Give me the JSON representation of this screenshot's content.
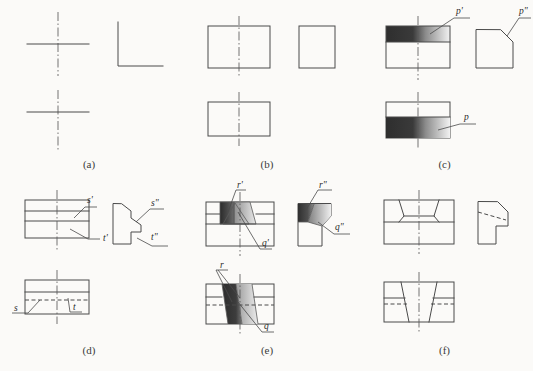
{
  "figure": {
    "background_color": "#fbfaf8",
    "line_color": "#4a4a4a",
    "panel_columns": 3,
    "panel_rows": 2
  },
  "panels": [
    {
      "id": "a",
      "caption": "(a)",
      "description": "Point projections: crossed centre lines in front and top views, corner lines in side view",
      "labels": [],
      "views": [
        "front",
        "side",
        "top"
      ]
    },
    {
      "id": "b",
      "caption": "(b)",
      "description": "Rectangular plate: rectangle front view, square side view, rectangle top view",
      "labels": [],
      "views": [
        "front",
        "side",
        "top"
      ]
    },
    {
      "id": "c",
      "caption": "(c)",
      "description": "Inclined plane p: shaded band in front and top views, chamfered corner in side view",
      "labels": [
        "p'",
        "p\"",
        "p"
      ],
      "views": [
        "front",
        "side",
        "top"
      ]
    },
    {
      "id": "d",
      "caption": "(d)",
      "description": "Planes s and t on a stepped block with notch",
      "labels": [
        "s'",
        "t'",
        "s\"",
        "t\"",
        "s",
        "t"
      ],
      "views": [
        "front",
        "side",
        "top"
      ]
    },
    {
      "id": "e",
      "caption": "(e)",
      "description": "Planes r and q on a block with a tapered slot, shaded faces",
      "labels": [
        "r'",
        "q'",
        "r\"",
        "q\"",
        "r",
        "q"
      ],
      "views": [
        "front",
        "side",
        "top"
      ]
    },
    {
      "id": "f",
      "caption": "(f)",
      "description": "Block with dovetail groove, hidden edges dashed in side and top views",
      "labels": [],
      "views": [
        "front",
        "side",
        "top"
      ]
    }
  ],
  "labels": {
    "p_front": "p'",
    "p_side": "p\"",
    "p_top": "p",
    "s_front": "s'",
    "t_front": "t'",
    "s_side": "s\"",
    "t_side": "t\"",
    "s_top": "s",
    "t_top": "t",
    "r_front": "r'",
    "q_front": "q'",
    "r_side": "r\"",
    "q_side": "q\"",
    "r_top": "r",
    "q_top": "q"
  },
  "captions": {
    "a": "(a)",
    "b": "(b)",
    "c": "(c)",
    "d": "(d)",
    "e": "(e)",
    "f": "(f)"
  }
}
